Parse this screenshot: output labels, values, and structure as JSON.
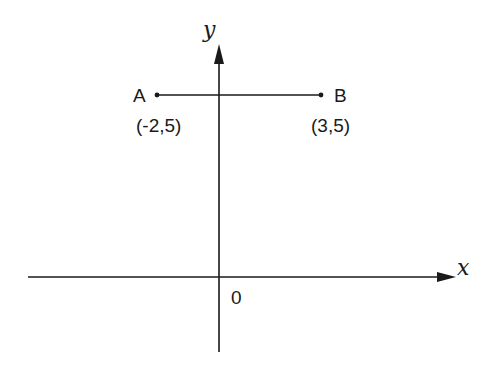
{
  "diagram": {
    "type": "coordinate-plane",
    "axes": {
      "x_label": "x",
      "y_label": "y",
      "origin_label": "0"
    },
    "points": [
      {
        "name": "A",
        "coords": "(-2,5)",
        "x": -2,
        "y": 5
      },
      {
        "name": "B",
        "coords": "(3,5)",
        "x": 3,
        "y": 5
      }
    ],
    "segments": [
      {
        "from": "A",
        "to": "B"
      }
    ],
    "colors": {
      "stroke": "#1a1a1a",
      "background": "#ffffff"
    }
  }
}
